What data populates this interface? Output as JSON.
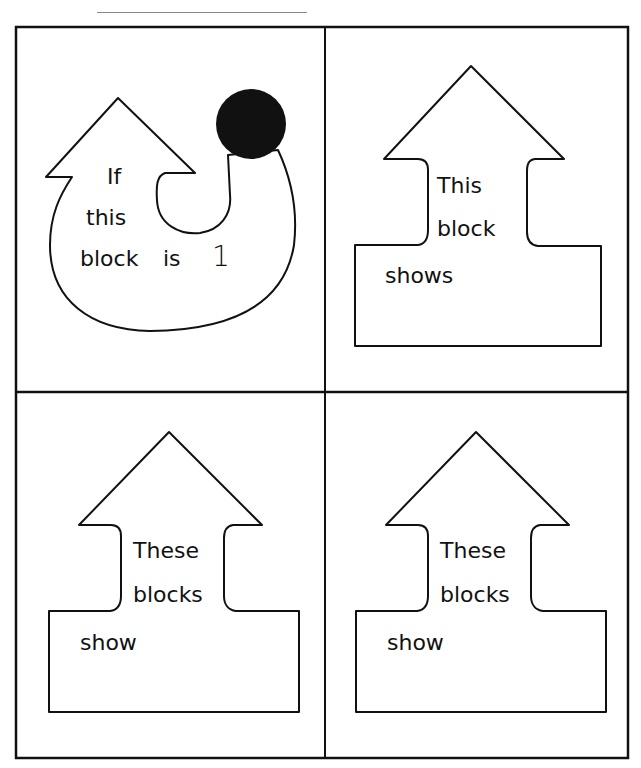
{
  "worksheet": {
    "name_line": "",
    "cards": [
      {
        "position": "top-left",
        "shape": "hook-arrow",
        "lines": [
          "If",
          "this",
          "block",
          "is"
        ],
        "number": "1",
        "dot_icon": "filled-circle"
      },
      {
        "position": "top-right",
        "shape": "up-arrow",
        "lines": [
          "This",
          "block",
          "shows"
        ]
      },
      {
        "position": "bottom-left",
        "shape": "up-arrow",
        "lines": [
          "These",
          "blocks",
          "show"
        ]
      },
      {
        "position": "bottom-right",
        "shape": "up-arrow",
        "lines": [
          "These",
          "blocks",
          "show"
        ]
      }
    ]
  }
}
